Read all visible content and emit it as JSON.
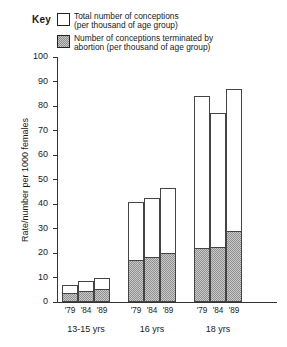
{
  "legend": {
    "title": "Key",
    "entries": [
      {
        "swatch": "total",
        "line1": "Total number of conceptions",
        "line2": "(per thousand of age group)"
      },
      {
        "swatch": "abortion",
        "line1": "Number of conceptions terminated by",
        "line2": "abortion (per thousand of age group)"
      }
    ]
  },
  "axes": {
    "ylabel": "Rate/number per 1000 females",
    "yticks": [
      "0",
      "10",
      "20",
      "30",
      "40",
      "50",
      "60",
      "70",
      "80",
      "90",
      "100"
    ],
    "year_labels": [
      "'79",
      "'84",
      "'89"
    ],
    "group_labels": [
      "13-15 yrs",
      "16 yrs",
      "18 yrs"
    ]
  },
  "colors": {
    "axis": "#333333",
    "bar_outline": "#444444",
    "total_fill": "#ffffff",
    "abortion_fill": "#c9c9c9",
    "abortion_hatch": "#909090"
  },
  "chart_data": {
    "type": "bar",
    "title": "",
    "subtitle": "",
    "xlabel": "",
    "ylabel": "Rate/number per 1000 females",
    "ylim": [
      0,
      100
    ],
    "ytick_step": 10,
    "grid": false,
    "legend_position": "top",
    "stacked": "overlay",
    "groups": [
      "13-15 yrs",
      "16 yrs",
      "18 yrs"
    ],
    "x": [
      "'79",
      "'84",
      "'89"
    ],
    "series": [
      {
        "name": "Total number of conceptions (per thousand of age group)",
        "values_by_group": {
          "13-15 yrs": [
            7,
            8.5,
            10
          ],
          "16 yrs": [
            41,
            42.5,
            46.5
          ],
          "18 yrs": [
            84,
            77,
            87
          ]
        }
      },
      {
        "name": "Number of conceptions terminated by abortion (per thousand of age group)",
        "values_by_group": {
          "13-15 yrs": [
            3.5,
            4.5,
            5.5
          ],
          "16 yrs": [
            17,
            18.5,
            20
          ],
          "18 yrs": [
            22,
            22.5,
            29
          ]
        }
      }
    ]
  }
}
